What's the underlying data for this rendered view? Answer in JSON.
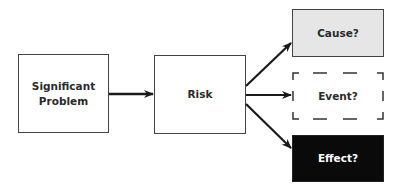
{
  "diagram": {
    "type": "flowchart",
    "nodes": [
      {
        "id": "problem",
        "label_line1": "Significant",
        "label_line2": "Problem",
        "style": "solid",
        "fill": "#ffffff",
        "text_color": "#2a2a2a"
      },
      {
        "id": "risk",
        "label": "Risk",
        "style": "solid",
        "fill": "#ffffff",
        "text_color": "#2a2a2a"
      },
      {
        "id": "cause",
        "label": "Cause?",
        "style": "solid",
        "fill": "#e6e6e6",
        "text_color": "#2a2a2a"
      },
      {
        "id": "event",
        "label": "Event?",
        "style": "dashed",
        "fill": "#ffffff",
        "text_color": "#2a2a2a"
      },
      {
        "id": "effect",
        "label": "Effect?",
        "style": "solid",
        "fill": "#0a0a0a",
        "text_color": "#ffffff"
      }
    ],
    "edges": [
      {
        "from": "problem",
        "to": "risk"
      },
      {
        "from": "risk",
        "to": "cause"
      },
      {
        "from": "risk",
        "to": "event"
      },
      {
        "from": "risk",
        "to": "effect"
      }
    ],
    "colors": {
      "stroke": "#222222",
      "cause_fill": "#e6e6e6",
      "effect_fill": "#0a0a0a"
    }
  }
}
